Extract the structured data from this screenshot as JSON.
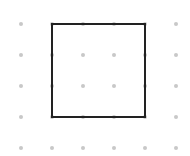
{
  "canvas": {
    "width": 190,
    "height": 156,
    "background": "#ffffff"
  },
  "grid": {
    "columns_x": [
      21,
      52,
      83,
      114,
      145,
      176
    ],
    "rows_y": [
      24,
      55,
      86,
      117,
      148
    ],
    "dot_color": "#c8c8c8",
    "dot_radius": 2
  },
  "shape": {
    "type": "square",
    "x": 52,
    "y": 24,
    "width": 93,
    "height": 93,
    "stroke": "#222222",
    "stroke_width": 2
  }
}
